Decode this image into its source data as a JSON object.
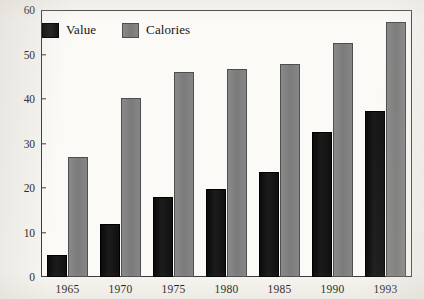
{
  "chart_data": {
    "type": "bar",
    "title": "",
    "xlabel": "",
    "ylabel": "",
    "categories": [
      "1965",
      "1970",
      "1975",
      "1980",
      "1985",
      "1990",
      "1993"
    ],
    "series": [
      {
        "name": "Value",
        "color": "#141414",
        "values": [
          5,
          12,
          18,
          19.7,
          23.6,
          32.7,
          37.4
        ]
      },
      {
        "name": "Calories",
        "color": "#818181",
        "values": [
          27,
          40.2,
          46,
          46.7,
          47.8,
          52.5,
          57.4
        ]
      }
    ],
    "ylim": [
      0,
      60
    ],
    "yticks": [
      0,
      10,
      20,
      30,
      40,
      50,
      60
    ],
    "ytick_labels": [
      "0",
      "10",
      "20",
      "30",
      "40",
      "50",
      "60"
    ],
    "grid": false,
    "legend_position": "top-left",
    "frame": true
  },
  "legend": {
    "entries": [
      {
        "label": "Value",
        "swatch": "value"
      },
      {
        "label": "Calories",
        "swatch": "calories"
      }
    ]
  }
}
